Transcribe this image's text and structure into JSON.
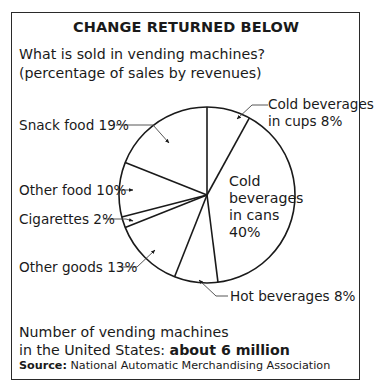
{
  "header": {
    "title": "CHANGE RETURNED BELOW",
    "question": "What is sold in vending machines?",
    "subtitle": "(percentage of sales by revenues)"
  },
  "labels": {
    "cold_cups_line1": "Cold beverages",
    "cold_cups_line2": "in cups 8%",
    "snack": "Snack food 19%",
    "other_food": "Other food 10%",
    "cigarettes": "Cigarettes 2%",
    "other_goods": "Other goods 13%",
    "hot": "Hot beverages 8%",
    "cans_line1": "Cold",
    "cans_line2": "beverages",
    "cans_line3": "in cans",
    "cans_line4": "40%"
  },
  "footer": {
    "line1": "Number of vending machines",
    "line2_prefix": "in the United States: ",
    "line2_bold": "about 6 million",
    "source_label": "Source:",
    "source_text": " National Automatic Merchandising Association"
  },
  "colors": {
    "ink": "#1a1a1a",
    "background": "#ffffff",
    "frame": "#2a2a2a"
  },
  "chart_data": {
    "type": "pie",
    "title": "CHANGE RETURNED BELOW",
    "subtitle": "What is sold in vending machines? (percentage of sales by revenues)",
    "categories": [
      "Cold beverages in cups",
      "Cold beverages in cans",
      "Hot beverages",
      "Other goods",
      "Cigarettes",
      "Other food",
      "Snack food"
    ],
    "values": [
      8,
      40,
      8,
      13,
      2,
      10,
      19
    ],
    "unit": "%",
    "start_angle": "12 o'clock, clockwise",
    "annotations": [
      "Number of vending machines in the United States: about 6 million",
      "Source: National Automatic Merchandising Association"
    ],
    "legend": "none (direct labels with leader arrows)"
  }
}
